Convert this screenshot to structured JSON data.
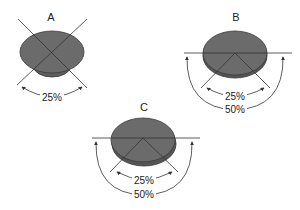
{
  "diagram": {
    "panels": [
      {
        "id": "A",
        "label": "A",
        "arcs": [
          {
            "label": "25%"
          }
        ]
      },
      {
        "id": "B",
        "label": "B",
        "arcs": [
          {
            "label": "25%"
          },
          {
            "label": "50%"
          }
        ]
      },
      {
        "id": "C",
        "label": "C",
        "arcs": [
          {
            "label": "25%"
          },
          {
            "label": "50%"
          }
        ]
      }
    ],
    "colors": {
      "disc_fill": "#6b6b6b",
      "disc_edge": "#3a3a3a",
      "lines": "#333333",
      "background": "#ffffff"
    }
  }
}
